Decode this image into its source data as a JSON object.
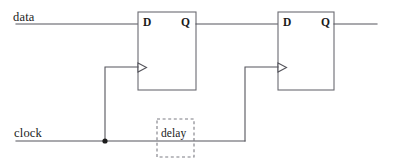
{
  "diagram": {
    "canvas": {
      "width": 393,
      "height": 168,
      "background": "#ffffff"
    },
    "colors": {
      "wire": "#55555c",
      "box_outline": "#6b6b72",
      "delay_outline": "#7d7d84",
      "junction": "#1c1c1c",
      "text": "#1b1b1b",
      "background": "#ffffff"
    }
  },
  "signals": {
    "data_label": "data",
    "clock_label": "clock"
  },
  "flipflops": [
    {
      "id": "ff1",
      "d_label": "D",
      "q_label": "Q",
      "box": {
        "x": 138,
        "y": 12,
        "width": 58,
        "height": 78
      },
      "clock_triangle": {
        "x": 138,
        "y": 63,
        "size": 9
      }
    },
    {
      "id": "ff2",
      "d_label": "D",
      "q_label": "Q",
      "box": {
        "x": 278,
        "y": 12,
        "width": 56,
        "height": 78
      },
      "clock_triangle": {
        "x": 278,
        "y": 63,
        "size": 9
      }
    }
  ],
  "delay_element": {
    "label": "delay",
    "box": {
      "x": 157,
      "y": 119,
      "width": 37,
      "height": 38
    },
    "style": "dashed"
  },
  "nets": {
    "data_in": {
      "y": 24,
      "x_start": 16,
      "x_end": 138
    },
    "q1_to_d2": {
      "y": 24,
      "x_start": 196,
      "x_end": 278
    },
    "q2_out": {
      "y": 24,
      "x_start": 334,
      "x_end": 377
    },
    "clock_bus": {
      "y": 141,
      "x_start": 16,
      "x_end": 245
    },
    "clock_branch_1": {
      "x": 105,
      "y_from": 141,
      "y_to": 67,
      "x_to": 138
    },
    "clock_branch_2": {
      "x": 245,
      "y_from": 141,
      "y_to": 67,
      "x_to": 278
    },
    "junction": {
      "x": 105,
      "y": 141,
      "radius": 2.6
    }
  }
}
